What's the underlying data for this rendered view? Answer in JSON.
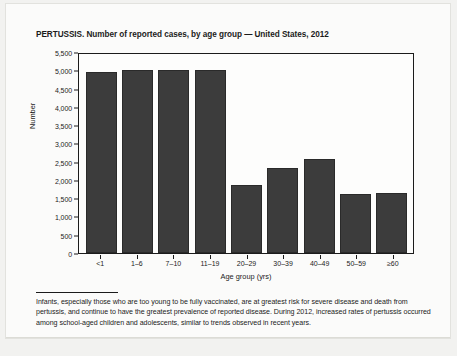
{
  "chart_title": "PERTUSSIS. Number of reported cases, by age group — United States, 2012",
  "axes": {
    "xlabel": "Age group (yrs)",
    "ylabel": "Number"
  },
  "footnote": "Infants, especially those who are too young to be fully vaccinated, are at greatest risk for severe disease and death from pertussis, and continue to have the greatest prevalence of reported disease. During 2012, increased rates of pertussis occurred among school-aged children and adolescents, similar to trends observed in recent years.",
  "colors": {
    "bar_fill": "#3c3c3c",
    "bar_stroke": "#2a2a2a",
    "axis": "#1b1b1b",
    "page": "#fbfbfa"
  },
  "chart_data": {
    "type": "bar",
    "title": "PERTUSSIS. Number of reported cases, by age group — United States, 2012",
    "xlabel": "Age group (yrs)",
    "ylabel": "Number",
    "categories": [
      "<1",
      "1–6",
      "7–10",
      "11–19",
      "20–29",
      "30–39",
      "40–49",
      "50–59",
      "≥60"
    ],
    "values": [
      4950,
      5000,
      5000,
      5000,
      1870,
      2320,
      2560,
      1610,
      1630
    ],
    "ylim": [
      0,
      5500
    ],
    "ytick_labels": [
      "5,500",
      "5,000",
      "4,500",
      "4,000",
      "3,500",
      "3,000",
      "2,500",
      "2,000",
      "1,500",
      "1,000",
      "500",
      "0"
    ],
    "ytick_values": [
      5500,
      5000,
      4500,
      4000,
      3500,
      3000,
      2500,
      2000,
      1500,
      1000,
      500,
      0
    ],
    "grid": false,
    "legend": null
  }
}
